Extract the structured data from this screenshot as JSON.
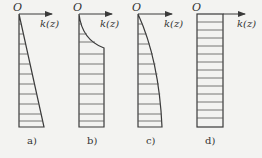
{
  "figure": {
    "axis_origin_label": "O",
    "axis_label": "k(z)",
    "panels": [
      {
        "id": "a",
        "label": "a)",
        "shape": "linear-increasing"
      },
      {
        "id": "b",
        "label": "b)",
        "shape": "curved-then-constant"
      },
      {
        "id": "c",
        "label": "c)",
        "shape": "parabolic-increasing"
      },
      {
        "id": "d",
        "label": "d)",
        "shape": "constant"
      }
    ]
  },
  "colors": {
    "line": "#3a3a3a",
    "background": "#f3f3f1"
  }
}
